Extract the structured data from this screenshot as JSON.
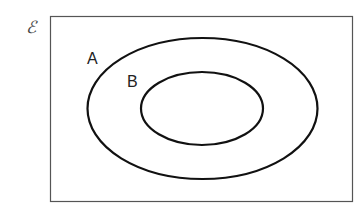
{
  "diagram": {
    "type": "venn",
    "universal_set": {
      "symbol": "ℰ",
      "rect": {
        "x": 50.5,
        "y": 16.5,
        "width": 302,
        "height": 185
      },
      "stroke": "#555555"
    },
    "sets": [
      {
        "label": "A",
        "cx": 202.5,
        "cy": 108.5,
        "rx": 115,
        "ry": 70.5,
        "label_x": 87,
        "label_y": 64
      },
      {
        "label": "B",
        "cx": 202,
        "cy": 108.5,
        "rx": 61,
        "ry": 36.5,
        "label_x": 127,
        "label_y": 87
      }
    ],
    "relationship": "B is a subset of A",
    "stroke": "#111111"
  }
}
